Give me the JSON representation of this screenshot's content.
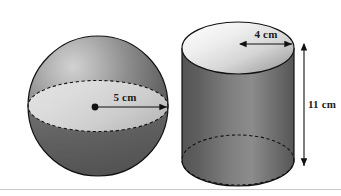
{
  "figure": {
    "background_color": "#ffffff",
    "divider_color": "#c9c9c9",
    "outline_color": "#121212",
    "label_color": "#1a1a1a"
  },
  "sphere": {
    "name": "sphere",
    "radius_label": "5 cm",
    "center_dot": "center-point",
    "fill_dark": "#585858",
    "fill_mid": "#8a8a8a",
    "fill_light": "#d8d8d8",
    "highlight": "#cfcfcf",
    "equator_band_color": "#d9d9d9"
  },
  "cylinder": {
    "name": "cylinder",
    "radius_label": "4 cm",
    "height_label": "11 cm",
    "top_face_light": "#f2f2f2",
    "top_face_dark": "#9a9a9a",
    "body_dark": "#5c5c5c",
    "body_light": "#8f8f8f"
  },
  "labels": {
    "sphere_radius": "5 cm",
    "cylinder_radius": "4 cm",
    "cylinder_height": "11 cm"
  }
}
